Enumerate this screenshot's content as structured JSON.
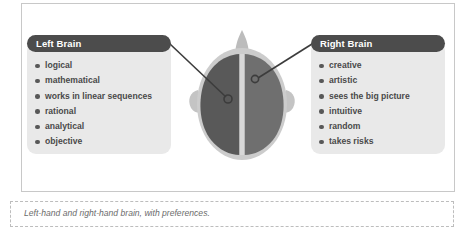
{
  "figure": {
    "caption": "Left-hand and right-hand brain, with preferences."
  },
  "panels": {
    "left": {
      "title": "Left Brain",
      "items": [
        "logical",
        "mathematical",
        "works in linear sequences",
        "rational",
        "analytical",
        "objective"
      ]
    },
    "right": {
      "title": "Right Brain",
      "items": [
        "creative",
        "artistic",
        "sees the big picture",
        "intuitive",
        "random",
        "takes risks"
      ]
    }
  },
  "illustration": {
    "name": "top-down human head with two brain hemispheres",
    "parts": {
      "head": "head-outline",
      "nose": "nose",
      "ear_left": "left-ear",
      "ear_right": "right-ear",
      "hemisphere_left": "left-hemisphere",
      "hemisphere_right": "right-hemisphere"
    },
    "colors": {
      "head": "#c9c9c9",
      "hemisphere_left": "#595959",
      "hemisphere_right": "#6f6f6f",
      "fissure": "#d6d6d6",
      "connector": "#3c3c3c"
    }
  },
  "theme": {
    "panel_background": "#e9e9e9",
    "header_background": "#4c4c4c",
    "header_text": "#ffffff",
    "list_text": "#4a4a4a",
    "box_border": "#c8c8c8",
    "caption_border": "#bdbdbd",
    "caption_text": "#6b6b6b"
  }
}
